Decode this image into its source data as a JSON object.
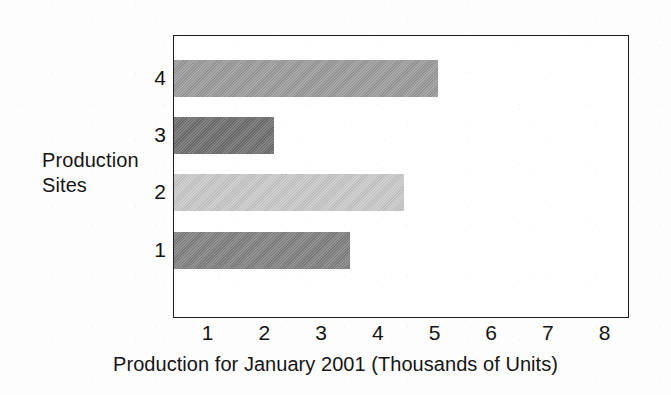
{
  "chart_data": {
    "type": "bar",
    "orientation": "horizontal",
    "title": "",
    "xlabel": "Production for January 2001 (Thousands of Units)",
    "ylabel": "Production Sites",
    "ylabel_lines": [
      "Production",
      "Sites"
    ],
    "categories": [
      "1",
      "2",
      "3",
      "4"
    ],
    "values": [
      3.5,
      4.45,
      2.15,
      5.05
    ],
    "series": [
      {
        "name": "Production",
        "values": [
          3.5,
          4.45,
          2.15,
          5.05
        ]
      }
    ],
    "bars": [
      {
        "category": "4",
        "value": 5.05,
        "color": "#9a9a9a"
      },
      {
        "category": "3",
        "value": 2.15,
        "color": "#6e6e6e"
      },
      {
        "category": "2",
        "value": 4.45,
        "color": "#c8c8c8"
      },
      {
        "category": "1",
        "value": 3.5,
        "color": "#808080"
      }
    ],
    "xlim": [
      0,
      8.45
    ],
    "xticks": [
      1,
      2,
      3,
      4,
      5,
      6,
      7,
      8
    ],
    "xtick_labels": [
      "1",
      "2",
      "3",
      "4",
      "5",
      "6",
      "7",
      "8"
    ],
    "ytick_labels": [
      "4",
      "3",
      "2",
      "1"
    ],
    "grid": false,
    "legend": "none",
    "axis_border_color": "#1c1c1c",
    "background_color": "#ffffff"
  }
}
